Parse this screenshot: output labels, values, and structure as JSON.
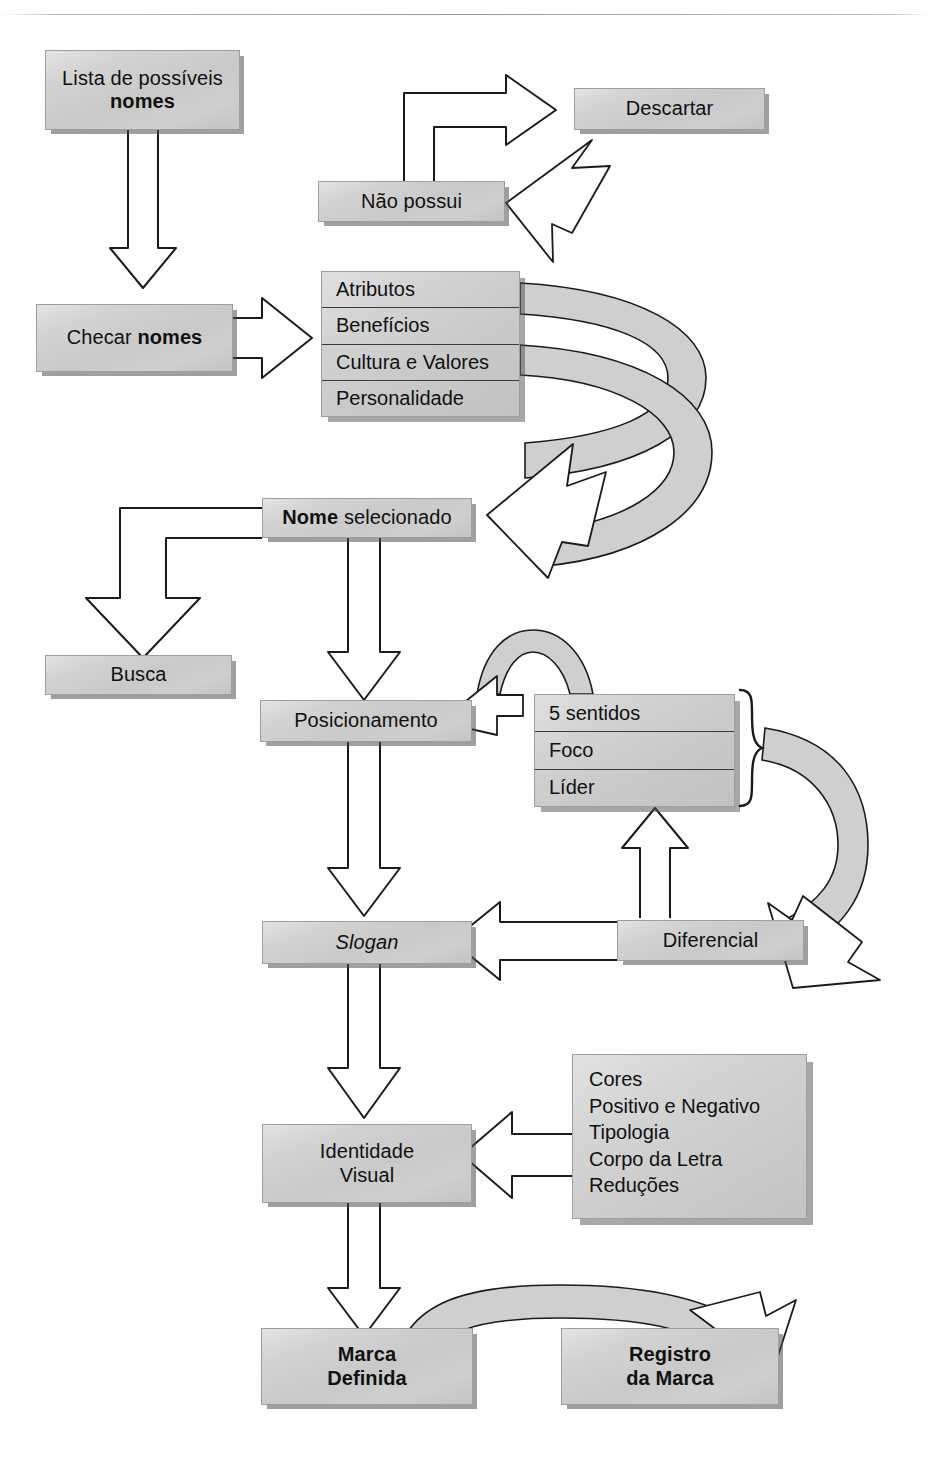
{
  "diagram": {
    "language": "pt-BR",
    "colors": {
      "box_fill": "#cccccc",
      "box_border": "#9e9e9e",
      "box_shadow": "#555555",
      "arrow_fill": "#ffffff",
      "arrow_stroke": "#1a1a1a",
      "ribbon_fill": "#cfcfcf",
      "text": "#111111",
      "page_background": "#ffffff"
    },
    "nodes": {
      "lista_nomes": {
        "line1": "Lista de possíveis",
        "line2": "nomes"
      },
      "checar_nomes": {
        "prefix": "Checar ",
        "bold": "nomes"
      },
      "nao_possui": {
        "label": "Não possui"
      },
      "descartar": {
        "label": "Descartar"
      },
      "criterios": {
        "items": [
          "Atributos",
          "Benefícios",
          "Cultura e Valores",
          "Personalidade"
        ]
      },
      "nome_selecionado": {
        "bold": "Nome",
        "rest": " selecionado"
      },
      "busca": {
        "label": "Busca"
      },
      "posicionamento": {
        "label": "Posicionamento"
      },
      "sentidos": {
        "items": [
          "5 sentidos",
          "Foco",
          "Líder"
        ]
      },
      "slogan": {
        "label": "Slogan"
      },
      "diferencial": {
        "label": "Diferencial"
      },
      "identidade_visual": {
        "line1": "Identidade",
        "line2": "Visual"
      },
      "identidade_itens": {
        "items": [
          "Cores",
          "Positivo e Negativo",
          "Tipologia",
          "Corpo da Letra",
          "Reduções"
        ]
      },
      "marca_definida": {
        "line1": "Marca",
        "line2": "Definida"
      },
      "registro_marca": {
        "line1": "Registro",
        "line2": "da Marca"
      }
    },
    "edges": [
      {
        "from": "lista_nomes",
        "to": "checar_nomes",
        "style": "hollow-arrow-down"
      },
      {
        "from": "checar_nomes",
        "to": "criterios",
        "style": "hollow-arrow-right"
      },
      {
        "from": "nao_possui",
        "to": "descartar",
        "style": "hollow-arrow-elbow-up-right"
      },
      {
        "from": "criterios",
        "to": "nao_possui",
        "style": "ribbon-curve-up-left"
      },
      {
        "from": "criterios",
        "to": "nome_selecionado",
        "style": "ribbon-curve-down-left"
      },
      {
        "from": "nome_selecionado",
        "to": "busca",
        "style": "hollow-arrow-elbow-down-left"
      },
      {
        "from": "nome_selecionado",
        "to": "posicionamento",
        "style": "hollow-arrow-down"
      },
      {
        "from": "sentidos",
        "to": "posicionamento",
        "style": "ribbon-curve-left"
      },
      {
        "from": "sentidos",
        "to": "diferencial-area",
        "style": "ribbon-curve-right-down"
      },
      {
        "from": "posicionamento",
        "to": "slogan",
        "style": "hollow-arrow-down"
      },
      {
        "from": "diferencial",
        "to": "slogan",
        "style": "hollow-arrow-left"
      },
      {
        "from": "diferencial",
        "to": "sentidos",
        "style": "hollow-arrow-up"
      },
      {
        "from": "slogan",
        "to": "identidade_visual",
        "style": "hollow-arrow-down"
      },
      {
        "from": "identidade_itens",
        "to": "identidade_visual",
        "style": "hollow-arrow-left"
      },
      {
        "from": "identidade_visual",
        "to": "marca_definida",
        "style": "hollow-arrow-down"
      },
      {
        "from": "marca_definida",
        "to": "registro_marca",
        "style": "ribbon-curve-right"
      }
    ]
  }
}
